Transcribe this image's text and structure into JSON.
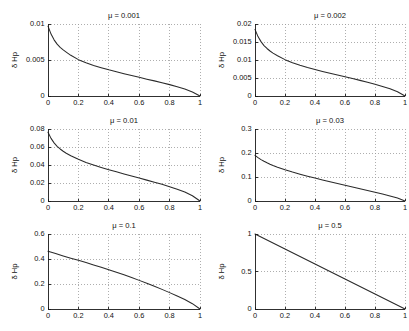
{
  "figure": {
    "width": 409,
    "height": 331,
    "background": "#ffffff",
    "curve_color": "#2a2a2a",
    "grid_color": "#9a9a9a",
    "axis_color": "#1a1a1a",
    "layout": "3 rows x 2 columns of subplots"
  },
  "chart_data": [
    {
      "type": "line",
      "title": "μ = 0.001",
      "xlabel": "",
      "ylabel": "δ Hp",
      "xlim": [
        0,
        1
      ],
      "ylim": [
        0,
        0.01
      ],
      "xticks": [
        0,
        0.2,
        0.4,
        0.6,
        0.8,
        1
      ],
      "xticklabels": [
        "0",
        "0.2",
        "0.4",
        "0.6",
        "0.8",
        "1"
      ],
      "yticks": [
        0,
        0.005,
        0.01
      ],
      "yticklabels": [
        "0",
        "0.005",
        "0.01"
      ],
      "grid": true,
      "legend": "none",
      "x": [
        0,
        0.02,
        0.04,
        0.06,
        0.08,
        0.1,
        0.12,
        0.15,
        0.2,
        0.25,
        0.3,
        0.35,
        0.4,
        0.45,
        0.5,
        0.55,
        0.6,
        0.65,
        0.7,
        0.75,
        0.8,
        0.85,
        0.9,
        0.95,
        1
      ],
      "y": [
        0.0097,
        0.0086,
        0.0078,
        0.0072,
        0.00675,
        0.0064,
        0.0061,
        0.00565,
        0.00505,
        0.00462,
        0.00425,
        0.00393,
        0.00363,
        0.00336,
        0.00309,
        0.00284,
        0.00259,
        0.00234,
        0.0021,
        0.00185,
        0.00158,
        0.00128,
        0.00096,
        0.00056,
        0.0
      ]
    },
    {
      "type": "line",
      "title": "μ = 0.002",
      "xlabel": "",
      "ylabel": "δ Hp",
      "xlim": [
        0,
        1
      ],
      "ylim": [
        0,
        0.02
      ],
      "xticks": [
        0,
        0.2,
        0.4,
        0.6,
        0.8,
        1
      ],
      "xticklabels": [
        "0",
        "0.2",
        "0.4",
        "0.6",
        "0.8",
        "1"
      ],
      "yticks": [
        0,
        0.005,
        0.01,
        0.015,
        0.02
      ],
      "yticklabels": [
        "0",
        "0.005",
        "0.01",
        "0.015",
        "0.02"
      ],
      "grid": true,
      "legend": "none",
      "x": [
        0,
        0.02,
        0.04,
        0.06,
        0.08,
        0.1,
        0.12,
        0.15,
        0.2,
        0.25,
        0.3,
        0.35,
        0.4,
        0.45,
        0.5,
        0.55,
        0.6,
        0.65,
        0.7,
        0.75,
        0.8,
        0.85,
        0.9,
        0.95,
        1
      ],
      "y": [
        0.0185,
        0.0165,
        0.0151,
        0.014,
        0.0132,
        0.0125,
        0.0119,
        0.0112,
        0.0101,
        0.00925,
        0.00855,
        0.00792,
        0.00735,
        0.00682,
        0.00631,
        0.00582,
        0.00533,
        0.00484,
        0.00434,
        0.00382,
        0.00327,
        0.00267,
        0.00201,
        0.00118,
        0.0
      ]
    },
    {
      "type": "line",
      "title": "μ = 0.01",
      "xlabel": "",
      "ylabel": "δ Hp",
      "xlim": [
        0,
        1
      ],
      "ylim": [
        0,
        0.08
      ],
      "xticks": [
        0,
        0.2,
        0.4,
        0.6,
        0.8,
        1
      ],
      "xticklabels": [
        "0",
        "0.2",
        "0.4",
        "0.6",
        "0.8",
        "1"
      ],
      "yticks": [
        0,
        0.02,
        0.04,
        0.06,
        0.08
      ],
      "yticklabels": [
        "0",
        "0.02",
        "0.04",
        "0.06",
        "0.08"
      ],
      "grid": true,
      "legend": "none",
      "x": [
        0,
        0.02,
        0.04,
        0.06,
        0.08,
        0.1,
        0.12,
        0.15,
        0.2,
        0.25,
        0.3,
        0.35,
        0.4,
        0.45,
        0.5,
        0.55,
        0.6,
        0.65,
        0.7,
        0.75,
        0.8,
        0.85,
        0.9,
        0.95,
        1
      ],
      "y": [
        0.0765,
        0.0696,
        0.0646,
        0.0608,
        0.0578,
        0.0553,
        0.0531,
        0.0503,
        0.0463,
        0.0429,
        0.04,
        0.0373,
        0.0348,
        0.0324,
        0.0301,
        0.0278,
        0.0255,
        0.0232,
        0.0209,
        0.0185,
        0.0159,
        0.0131,
        0.00993,
        0.00588,
        0.0
      ]
    },
    {
      "type": "line",
      "title": "μ = 0.03",
      "xlabel": "",
      "ylabel": "δ Hp",
      "xlim": [
        0,
        1
      ],
      "ylim": [
        0,
        0.3
      ],
      "xticks": [
        0,
        0.2,
        0.4,
        0.6,
        0.8,
        1
      ],
      "xticklabels": [
        "0",
        "0.2",
        "0.4",
        "0.6",
        "0.8",
        "1"
      ],
      "yticks": [
        0,
        0.1,
        0.2,
        0.3
      ],
      "yticklabels": [
        "0",
        "0.1",
        "0.2",
        "0.3"
      ],
      "grid": true,
      "legend": "none",
      "x": [
        0,
        0.02,
        0.04,
        0.06,
        0.08,
        0.1,
        0.12,
        0.15,
        0.2,
        0.25,
        0.3,
        0.35,
        0.4,
        0.45,
        0.5,
        0.55,
        0.6,
        0.65,
        0.7,
        0.75,
        0.8,
        0.85,
        0.9,
        0.95,
        1
      ],
      "y": [
        0.19,
        0.1805,
        0.1725,
        0.1655,
        0.1592,
        0.1535,
        0.1482,
        0.141,
        0.1302,
        0.1206,
        0.1118,
        0.1035,
        0.0955,
        0.0878,
        0.0803,
        0.0729,
        0.0656,
        0.0584,
        0.0512,
        0.0439,
        0.0365,
        0.029,
        0.0212,
        0.0121,
        0.0
      ]
    },
    {
      "type": "line",
      "title": "μ = 0.1",
      "xlabel": "",
      "ylabel": "δ Hp",
      "xlim": [
        0,
        1
      ],
      "ylim": [
        0,
        0.6
      ],
      "xticks": [
        0,
        0.2,
        0.4,
        0.6,
        0.8,
        1
      ],
      "xticklabels": [
        "0",
        "0.2",
        "0.4",
        "0.6",
        "0.8",
        "1"
      ],
      "yticks": [
        0,
        0.2,
        0.4,
        0.6
      ],
      "yticklabels": [
        "0",
        "0.2",
        "0.4",
        "0.6"
      ],
      "grid": true,
      "legend": "none",
      "x": [
        0,
        0.05,
        0.1,
        0.15,
        0.2,
        0.25,
        0.3,
        0.35,
        0.4,
        0.45,
        0.5,
        0.55,
        0.6,
        0.65,
        0.7,
        0.75,
        0.8,
        0.85,
        0.9,
        0.95,
        1
      ],
      "y": [
        0.462,
        0.443,
        0.425,
        0.407,
        0.389,
        0.371,
        0.353,
        0.334,
        0.314,
        0.294,
        0.273,
        0.252,
        0.229,
        0.206,
        0.182,
        0.157,
        0.131,
        0.104,
        0.0755,
        0.0425,
        0.0
      ]
    },
    {
      "type": "line",
      "title": "μ = 0.5",
      "xlabel": "",
      "ylabel": "δ Hp",
      "xlim": [
        0,
        1
      ],
      "ylim": [
        0,
        1
      ],
      "xticks": [
        0,
        0.2,
        0.4,
        0.6,
        0.8,
        1
      ],
      "xticklabels": [
        "0",
        "0.2",
        "0.4",
        "0.6",
        "0.8",
        "1"
      ],
      "yticks": [
        0,
        0.5,
        1
      ],
      "yticklabels": [
        "0",
        "0.5",
        "1"
      ],
      "grid": true,
      "legend": "none",
      "x": [
        0,
        0.1,
        0.2,
        0.3,
        0.4,
        0.5,
        0.6,
        0.7,
        0.8,
        0.9,
        0.95,
        1
      ],
      "y": [
        1.0,
        0.9,
        0.8,
        0.7,
        0.6,
        0.5,
        0.4,
        0.3,
        0.2,
        0.0998,
        0.0498,
        0.0
      ]
    }
  ]
}
